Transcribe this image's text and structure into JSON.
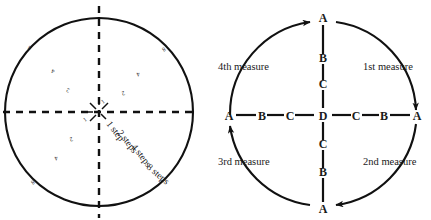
{
  "figure": {
    "panels": [
      {
        "id": "left-circle",
        "name": "step-circle-diagram",
        "step_labels": [
          {
            "text": "1 step",
            "rotation": 52
          },
          {
            "text": "2 steps",
            "rotation": 52
          },
          {
            "text": "4 steps",
            "rotation": 52
          },
          {
            "text": "8 steps",
            "rotation": 40
          }
        ],
        "quadrant_digits": [
          {
            "text": "4",
            "quadrant": "upper-left"
          },
          {
            "text": "2",
            "quadrant": "upper-left"
          },
          {
            "text": "4",
            "quadrant": "upper-right"
          },
          {
            "text": "2",
            "quadrant": "upper-right"
          },
          {
            "text": "2",
            "quadrant": "lower-left"
          },
          {
            "text": "4",
            "quadrant": "lower-left"
          }
        ],
        "edge_digits": [
          {
            "text": "8",
            "position": "upper-left"
          },
          {
            "text": "8",
            "position": "upper-right"
          },
          {
            "text": "8",
            "position": "lower-left"
          }
        ],
        "center_tick_digits": [
          {
            "text": "1",
            "position": "center-right"
          },
          {
            "text": "1",
            "position": "center-left"
          }
        ],
        "axes": {
          "style": "dashed",
          "vertical": true,
          "horizontal": true
        }
      },
      {
        "id": "right-circle",
        "name": "measure-circle-diagram",
        "measures": [
          {
            "label": "1st measure",
            "position": "upper-right"
          },
          {
            "label": "2nd measure",
            "position": "lower-right"
          },
          {
            "label": "3rd measure",
            "position": "lower-left"
          },
          {
            "label": "4th measure",
            "position": "upper-left"
          }
        ],
        "vertical_axis_letters": [
          "A",
          "B",
          "C",
          "D",
          "C",
          "B",
          "A"
        ],
        "horizontal_axis_letters": [
          "A",
          "B",
          "C",
          "D",
          "C",
          "B",
          "A"
        ],
        "node_top": "A",
        "node_bottom": "A",
        "node_left": "A",
        "node_right": "A",
        "node_center": "D",
        "arrows": [
          {
            "target": "top-A",
            "direction": "right"
          },
          {
            "target": "right-A",
            "direction": "down"
          },
          {
            "target": "bottom-A",
            "direction": "left"
          },
          {
            "target": "left-A",
            "direction": "up"
          }
        ]
      }
    ],
    "colors": {
      "stroke": "#111111",
      "text": "#1a1a1a",
      "background": "#ffffff"
    }
  }
}
